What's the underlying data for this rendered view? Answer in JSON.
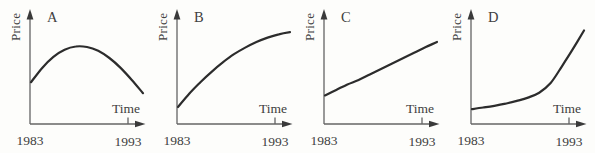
{
  "figure": {
    "colors": {
      "background": "#fdfdfb",
      "curve": "#2c2c2c",
      "axis": "#646464",
      "arrow": "#3a3a3a",
      "text": "#404040"
    }
  },
  "chart_data": [
    {
      "panel": "A",
      "type": "line",
      "title": "A",
      "xlabel": "Time",
      "ylabel": "Price",
      "x_tick_labels": [
        "1983",
        "1993"
      ],
      "x_range": [
        1983,
        1993
      ],
      "y_scale": "relative (axis unlabeled, 0-1 of plot height)",
      "trend": "price rises to a peak around the middle of the period then declines",
      "x": [
        1983,
        1984,
        1985,
        1986,
        1987,
        1988,
        1989,
        1990,
        1991,
        1992,
        1993
      ],
      "values": [
        0.38,
        0.51,
        0.61,
        0.675,
        0.705,
        0.7,
        0.665,
        0.6,
        0.51,
        0.4,
        0.28
      ]
    },
    {
      "panel": "B",
      "type": "line",
      "title": "B",
      "xlabel": "Time",
      "ylabel": "Price",
      "x_tick_labels": [
        "1983",
        "1993"
      ],
      "x_range": [
        1983,
        1993
      ],
      "y_scale": "relative (axis unlabeled, 0-1 of plot height)",
      "trend": "price rises at a decreasing rate (concave, levelling off)",
      "x": [
        1983,
        1984,
        1985,
        1986,
        1987,
        1988,
        1989,
        1990,
        1991,
        1992,
        1993
      ],
      "values": [
        0.155,
        0.275,
        0.38,
        0.475,
        0.56,
        0.635,
        0.695,
        0.745,
        0.785,
        0.815,
        0.835
      ]
    },
    {
      "panel": "C",
      "type": "line",
      "title": "C",
      "xlabel": "Time",
      "ylabel": "Price",
      "x_tick_labels": [
        "1983",
        "1993"
      ],
      "x_range": [
        1983,
        1993
      ],
      "y_scale": "relative (axis unlabeled, 0-1 of plot height)",
      "trend": "price rises steadily at a constant rate (straight line)",
      "x": [
        1983,
        1984,
        1985,
        1986,
        1987,
        1988,
        1989,
        1990,
        1991,
        1992,
        1993
      ],
      "values": [
        0.26,
        0.31,
        0.36,
        0.4,
        0.45,
        0.5,
        0.55,
        0.6,
        0.65,
        0.7,
        0.745
      ]
    },
    {
      "panel": "D",
      "type": "line",
      "title": "D",
      "xlabel": "Time",
      "ylabel": "Price",
      "x_tick_labels": [
        "1983",
        "1993"
      ],
      "x_range": [
        1983,
        1993
      ],
      "y_scale": "relative (axis unlabeled, 0-1 of plot height)",
      "trend": "price rises slowly at first then at an increasing (accelerating) rate",
      "x": [
        1983,
        1984,
        1985,
        1986,
        1987,
        1988,
        1989,
        1990,
        1991,
        1992,
        1993
      ],
      "values": [
        0.135,
        0.15,
        0.165,
        0.185,
        0.21,
        0.24,
        0.285,
        0.37,
        0.52,
        0.68,
        0.85
      ]
    }
  ]
}
